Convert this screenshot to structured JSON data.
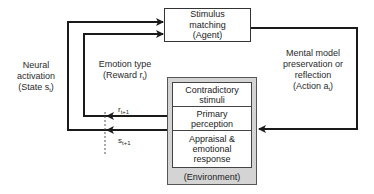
{
  "diagram": {
    "agent": {
      "line1": "Stimulus",
      "line2": "matching",
      "line3": "(Agent)"
    },
    "environment": {
      "caption": "(Environment)",
      "cells": [
        {
          "line1": "Contradictory",
          "line2": "stimuli"
        },
        {
          "line1": "Primary",
          "line2": "perception"
        },
        {
          "line1": "Appraisal &",
          "line2": "emotional",
          "line3": "response"
        }
      ]
    },
    "labels": {
      "state": {
        "line1": "Neural",
        "line2": "activation",
        "line3_prefix": "(State s",
        "line3_sub": "t",
        "line3_suffix": ")"
      },
      "reward": {
        "line1": "Emotion type",
        "line2_prefix": "(Reward r",
        "line2_sub": "t",
        "line2_suffix": ")"
      },
      "action": {
        "line1": "Mental model",
        "line2": "preservation or",
        "line3": "reflection",
        "line4_prefix": "(Action a",
        "line4_sub": "t",
        "line4_suffix": ")"
      },
      "next_reward": {
        "base": "r",
        "sub": "t+1"
      },
      "next_state": {
        "base": "s",
        "sub": "t+1"
      }
    },
    "colors": {
      "line": "#1a1a1a",
      "env_fill": "#d4d4d4",
      "box_fill": "#ffffff"
    }
  }
}
